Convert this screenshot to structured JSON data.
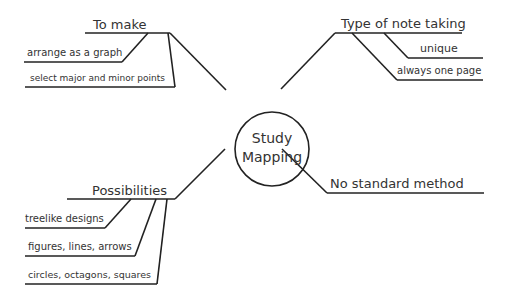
{
  "colors": {
    "line": "#222222",
    "text": "#333333",
    "background": "#ffffff"
  },
  "center": {
    "line1": "Study",
    "line2": "Mapping"
  },
  "branches": {
    "to_make": {
      "label": "To make",
      "items": [
        "arrange as a graph",
        "select major and minor points"
      ]
    },
    "type_of_note_taking": {
      "label": "Type of note taking",
      "items": [
        "unique",
        "always one page"
      ]
    },
    "possibilities": {
      "label": "Possibilities",
      "items": [
        "treelike designs",
        "figures, lines, arrows",
        "circles, octagons, squares"
      ]
    },
    "no_standard_method": {
      "label": "No standard method",
      "items": []
    }
  }
}
